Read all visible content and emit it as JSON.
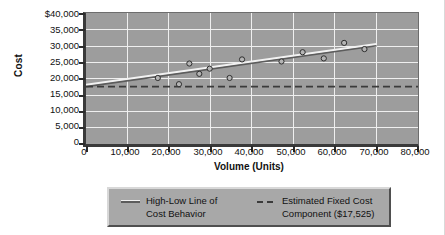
{
  "chart_data": {
    "type": "scatter",
    "title": "",
    "xlabel": "Volume (Units)",
    "ylabel": "Cost",
    "xlim": [
      0,
      80000
    ],
    "ylim": [
      0,
      40000
    ],
    "grid": true,
    "legend_position": "bottom",
    "x_ticks": [
      "0",
      "10,000",
      "20,000",
      "30,000",
      "40,000",
      "50,000",
      "60,000",
      "70,000",
      "80,000"
    ],
    "x_tick_values": [
      0,
      10000,
      20000,
      30000,
      40000,
      50000,
      60000,
      70000,
      80000
    ],
    "y_ticks": [
      "$40,000",
      "35,000",
      "30,000",
      "25,000",
      "20,000",
      "15,000",
      "10,000",
      "5,000",
      "0"
    ],
    "y_tick_values": [
      40000,
      35000,
      30000,
      25000,
      20000,
      15000,
      10000,
      5000,
      0
    ],
    "series": [
      {
        "name": "Observed Cost Points",
        "type": "scatter",
        "marker": "open-circle",
        "x": [
          17300,
          22400,
          24900,
          27300,
          29800,
          34600,
          37600,
          47100,
          52200,
          57300,
          62200,
          67100
        ],
        "y": [
          20160,
          18270,
          24570,
          21420,
          23000,
          20160,
          25830,
          25200,
          28030,
          26140,
          30870,
          28980
        ]
      },
      {
        "name": "High-Low Line of Cost Behavior",
        "type": "line",
        "style": "solid",
        "x": [
          0,
          70000
        ],
        "y": [
          17525,
          30000
        ]
      },
      {
        "name": "Estimated Fixed Cost Component ($17,525)",
        "type": "line",
        "style": "dashed",
        "x": [
          0,
          80000
        ],
        "y": [
          17525,
          17525
        ]
      }
    ],
    "annotations": {
      "fixed_cost_value": "$17,525"
    }
  },
  "axes": {
    "y_title": "Cost",
    "x_title": "Volume (Units)"
  },
  "legend": {
    "entries": [
      {
        "line1": "High-Low Line of",
        "line2": "Cost Behavior",
        "swatch": "solid-line-swatch"
      },
      {
        "line1": "Estimated Fixed Cost",
        "line2": "Component ($17,525)",
        "swatch": "dashed-line-swatch"
      }
    ]
  },
  "colors": {
    "plot_background": "#9d9d9d",
    "gridline": "#efefef",
    "axis": "#2b2b2b",
    "trend_line": "#5c5c5c",
    "trend_line_highlight": "#f2f2f2",
    "fixed_cost_line": "#3b3b3b",
    "legend_background": "#a8a8a8",
    "text": "#111111"
  }
}
